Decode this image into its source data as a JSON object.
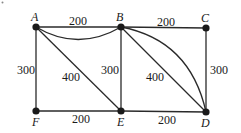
{
  "diagram": {
    "type": "weighted-graph",
    "nodes": [
      {
        "id": "A",
        "label": "A",
        "x": 36,
        "y": 27
      },
      {
        "id": "B",
        "label": "B",
        "x": 121,
        "y": 27
      },
      {
        "id": "C",
        "label": "C",
        "x": 206,
        "y": 28
      },
      {
        "id": "D",
        "label": "D",
        "x": 206,
        "y": 112
      },
      {
        "id": "E",
        "label": "E",
        "x": 121,
        "y": 111
      },
      {
        "id": "F",
        "label": "F",
        "x": 36,
        "y": 111
      }
    ],
    "edges": [
      {
        "from": "A",
        "to": "B",
        "weight": "200",
        "shape": "straight"
      },
      {
        "from": "A",
        "to": "B",
        "weight": "",
        "shape": "curved"
      },
      {
        "from": "B",
        "to": "C",
        "weight": "200",
        "shape": "straight"
      },
      {
        "from": "A",
        "to": "F",
        "weight": "300",
        "shape": "straight"
      },
      {
        "from": "A",
        "to": "E",
        "weight": "400",
        "shape": "straight"
      },
      {
        "from": "B",
        "to": "E",
        "weight": "300",
        "shape": "straight"
      },
      {
        "from": "B",
        "to": "D",
        "weight": "400",
        "shape": "straight"
      },
      {
        "from": "B",
        "to": "D",
        "weight": "",
        "shape": "curved"
      },
      {
        "from": "C",
        "to": "D",
        "weight": "300",
        "shape": "straight"
      },
      {
        "from": "F",
        "to": "E",
        "weight": "200",
        "shape": "straight"
      },
      {
        "from": "E",
        "to": "D",
        "weight": "200",
        "shape": "straight"
      }
    ],
    "labels": {
      "node_a": "A",
      "node_b": "B",
      "node_c": "C",
      "node_d": "D",
      "node_e": "E",
      "node_f": "F",
      "w_ab": "200",
      "w_bc": "200",
      "w_af": "300",
      "w_ae": "400",
      "w_be": "300",
      "w_bd": "400",
      "w_cd": "300",
      "w_fe": "200",
      "w_ed": "200"
    }
  }
}
